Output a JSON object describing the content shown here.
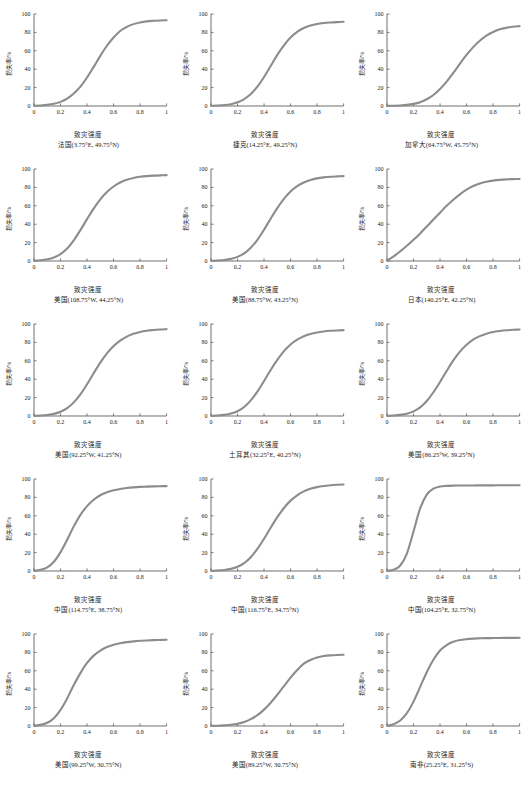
{
  "figure": {
    "axis_labels": {
      "x": "致灾强度",
      "y": "损失率/%"
    },
    "x_ticks": [
      "0",
      "0.2",
      "0.4",
      "0.6",
      "0.8",
      "1"
    ],
    "y_ticks": [
      "0",
      "20",
      "40",
      "60",
      "80",
      "100"
    ],
    "curve_color": "#8c8c8c",
    "axis_color": "#4a4a4a"
  },
  "chart_data": [
    {
      "type": "line",
      "title": "法国(3.75°E, 49.75°N)",
      "xlabel": "致灾强度",
      "ylabel": "损失率/%",
      "xlim": [
        0,
        1
      ],
      "ylim": [
        0,
        100
      ],
      "grid": false,
      "legend": "none",
      "x": [
        0,
        0.05,
        0.1,
        0.15,
        0.2,
        0.25,
        0.3,
        0.35,
        0.4,
        0.45,
        0.5,
        0.55,
        0.6,
        0.65,
        0.7,
        0.75,
        0.8,
        0.85,
        0.9,
        0.95,
        1
      ],
      "values": [
        0.3,
        0.6,
        1.2,
        2.4,
        4.5,
        8.0,
        13.5,
        21.0,
        31.0,
        42.5,
        54.5,
        65.5,
        74.5,
        81.5,
        86.0,
        89.0,
        90.8,
        92.0,
        92.6,
        93.0,
        93.2
      ]
    },
    {
      "type": "line",
      "title": "捷克(14.25°E, 49.25°N)",
      "xlabel": "致灾强度",
      "ylabel": "损失率/%",
      "xlim": [
        0,
        1
      ],
      "ylim": [
        0,
        100
      ],
      "grid": false,
      "legend": "none",
      "x": [
        0,
        0.05,
        0.1,
        0.15,
        0.2,
        0.25,
        0.3,
        0.35,
        0.4,
        0.45,
        0.5,
        0.55,
        0.6,
        0.65,
        0.7,
        0.75,
        0.8,
        0.85,
        0.9,
        0.95,
        1
      ],
      "values": [
        0.2,
        0.5,
        1.0,
        2.0,
        4.0,
        7.5,
        13.0,
        21.0,
        31.5,
        43.5,
        55.5,
        66.0,
        74.5,
        80.5,
        84.8,
        87.5,
        89.2,
        90.2,
        90.8,
        91.2,
        91.5
      ]
    },
    {
      "type": "line",
      "title": "加拿大(64.75°W, 45.75°N)",
      "xlabel": "致灾强度",
      "ylabel": "损失率/%",
      "xlim": [
        0,
        1
      ],
      "ylim": [
        0,
        100
      ],
      "grid": false,
      "legend": "none",
      "x": [
        0,
        0.05,
        0.1,
        0.15,
        0.2,
        0.25,
        0.3,
        0.35,
        0.4,
        0.45,
        0.5,
        0.55,
        0.6,
        0.65,
        0.7,
        0.75,
        0.8,
        0.85,
        0.9,
        0.95,
        1
      ],
      "values": [
        0.1,
        0.3,
        0.6,
        1.2,
        2.3,
        4.2,
        7.3,
        12.0,
        18.5,
        26.5,
        36.0,
        46.0,
        55.5,
        64.0,
        71.0,
        76.5,
        80.5,
        83.3,
        85.0,
        86.2,
        86.8
      ]
    },
    {
      "type": "line",
      "title": "美国(108.75°W, 44.25°N)",
      "xlabel": "致灾强度",
      "ylabel": "损失率/%",
      "xlim": [
        0,
        1
      ],
      "ylim": [
        0,
        100
      ],
      "grid": false,
      "legend": "none",
      "x": [
        0,
        0.05,
        0.1,
        0.15,
        0.2,
        0.25,
        0.3,
        0.35,
        0.4,
        0.45,
        0.5,
        0.55,
        0.6,
        0.65,
        0.7,
        0.75,
        0.8,
        0.85,
        0.9,
        0.95,
        1
      ],
      "values": [
        0.3,
        0.8,
        1.8,
        3.8,
        7.5,
        13.5,
        22.5,
        33.5,
        45.5,
        57.0,
        67.0,
        75.0,
        81.0,
        85.3,
        88.2,
        90.2,
        91.5,
        92.3,
        92.8,
        93.1,
        93.3
      ]
    },
    {
      "type": "line",
      "title": "美国(88.75°W, 43.25°N)",
      "xlabel": "致灾强度",
      "ylabel": "损失率/%",
      "xlim": [
        0,
        1
      ],
      "ylim": [
        0,
        100
      ],
      "grid": false,
      "legend": "none",
      "x": [
        0,
        0.05,
        0.1,
        0.15,
        0.2,
        0.25,
        0.3,
        0.35,
        0.4,
        0.45,
        0.5,
        0.55,
        0.6,
        0.65,
        0.7,
        0.75,
        0.8,
        0.85,
        0.9,
        0.95,
        1
      ],
      "values": [
        0.2,
        0.5,
        1.1,
        2.3,
        4.5,
        8.3,
        14.5,
        23.0,
        34.0,
        46.0,
        57.5,
        67.5,
        75.5,
        81.3,
        85.3,
        88.0,
        89.8,
        90.9,
        91.6,
        92.0,
        92.3
      ]
    },
    {
      "type": "line",
      "title": "日本(140.25°E, 42.25°N)",
      "xlabel": "致灾强度",
      "ylabel": "损失率/%",
      "xlim": [
        0,
        1
      ],
      "ylim": [
        0,
        100
      ],
      "grid": false,
      "legend": "none",
      "x": [
        0,
        0.05,
        0.1,
        0.15,
        0.2,
        0.25,
        0.3,
        0.35,
        0.4,
        0.45,
        0.5,
        0.55,
        0.6,
        0.65,
        0.7,
        0.75,
        0.8,
        0.85,
        0.9,
        0.95,
        1
      ],
      "values": [
        0.5,
        5.0,
        10.5,
        16.5,
        23.0,
        30.0,
        37.5,
        45.0,
        52.5,
        60.0,
        66.5,
        72.5,
        77.5,
        81.5,
        84.3,
        86.2,
        87.4,
        88.2,
        88.7,
        89.0,
        89.2
      ]
    },
    {
      "type": "line",
      "title": "美国(92.25°W, 41.25°N)",
      "xlabel": "致灾强度",
      "ylabel": "损失率/%",
      "xlim": [
        0,
        1
      ],
      "ylim": [
        0,
        100
      ],
      "grid": false,
      "legend": "none",
      "x": [
        0,
        0.05,
        0.1,
        0.15,
        0.2,
        0.25,
        0.3,
        0.35,
        0.4,
        0.45,
        0.5,
        0.55,
        0.6,
        0.65,
        0.7,
        0.75,
        0.8,
        0.85,
        0.9,
        0.95,
        1
      ],
      "values": [
        0.2,
        0.5,
        1.1,
        2.3,
        4.6,
        8.5,
        14.8,
        23.5,
        34.5,
        46.5,
        58.0,
        68.0,
        76.0,
        82.0,
        86.3,
        89.3,
        91.3,
        92.6,
        93.4,
        94.0,
        94.4
      ]
    },
    {
      "type": "line",
      "title": "土耳其(32.25°E, 40.25°N)",
      "xlabel": "致灾强度",
      "ylabel": "损失率/%",
      "xlim": [
        0,
        1
      ],
      "ylim": [
        0,
        100
      ],
      "grid": false,
      "legend": "none",
      "x": [
        0,
        0.05,
        0.1,
        0.15,
        0.2,
        0.25,
        0.3,
        0.35,
        0.4,
        0.45,
        0.5,
        0.55,
        0.6,
        0.65,
        0.7,
        0.75,
        0.8,
        0.85,
        0.9,
        0.95,
        1
      ],
      "values": [
        0.2,
        0.5,
        1.2,
        2.6,
        5.2,
        9.8,
        17.0,
        26.5,
        38.0,
        50.0,
        61.0,
        70.5,
        77.8,
        83.0,
        86.7,
        89.2,
        90.8,
        91.9,
        92.6,
        93.0,
        93.3
      ]
    },
    {
      "type": "line",
      "title": "美国(86.25°W, 39.25°N)",
      "xlabel": "致灾强度",
      "ylabel": "损失率/%",
      "xlim": [
        0,
        1
      ],
      "ylim": [
        0,
        100
      ],
      "grid": false,
      "legend": "none",
      "x": [
        0,
        0.05,
        0.1,
        0.15,
        0.2,
        0.25,
        0.3,
        0.35,
        0.4,
        0.45,
        0.5,
        0.55,
        0.6,
        0.65,
        0.7,
        0.75,
        0.8,
        0.85,
        0.9,
        0.95,
        1
      ],
      "values": [
        0.2,
        0.5,
        1.2,
        2.5,
        5.0,
        9.3,
        16.3,
        25.8,
        37.0,
        49.0,
        60.5,
        70.0,
        77.5,
        83.0,
        86.8,
        89.5,
        91.3,
        92.4,
        93.2,
        93.7,
        94.0
      ]
    },
    {
      "type": "line",
      "title": "中国(114.75°E, 38.75°N)",
      "xlabel": "致灾强度",
      "ylabel": "损失率/%",
      "xlim": [
        0,
        1
      ],
      "ylim": [
        0,
        100
      ],
      "grid": false,
      "legend": "none",
      "x": [
        0,
        0.05,
        0.1,
        0.15,
        0.2,
        0.25,
        0.3,
        0.35,
        0.4,
        0.45,
        0.5,
        0.55,
        0.6,
        0.65,
        0.7,
        0.75,
        0.8,
        0.85,
        0.9,
        0.95,
        1
      ],
      "values": [
        0.3,
        1.3,
        4.0,
        10.0,
        20.5,
        34.0,
        48.5,
        61.0,
        70.5,
        77.5,
        82.3,
        85.5,
        87.7,
        89.2,
        90.2,
        90.9,
        91.4,
        91.7,
        92.0,
        92.2,
        92.3
      ]
    },
    {
      "type": "line",
      "title": "中国(116.75°E, 34.75°N)",
      "xlabel": "致灾强度",
      "ylabel": "损失率/%",
      "xlim": [
        0,
        1
      ],
      "ylim": [
        0,
        100
      ],
      "grid": false,
      "legend": "none",
      "x": [
        0,
        0.05,
        0.1,
        0.15,
        0.2,
        0.25,
        0.3,
        0.35,
        0.4,
        0.45,
        0.5,
        0.55,
        0.6,
        0.65,
        0.7,
        0.75,
        0.8,
        0.85,
        0.9,
        0.95,
        1
      ],
      "values": [
        0.2,
        0.5,
        1.1,
        2.3,
        4.6,
        8.6,
        15.0,
        24.0,
        35.0,
        47.0,
        58.5,
        68.5,
        76.5,
        82.3,
        86.5,
        89.3,
        91.2,
        92.4,
        93.2,
        93.8,
        94.1
      ]
    },
    {
      "type": "line",
      "title": "中国(104.25°E, 32.75°N)",
      "xlabel": "致灾强度",
      "ylabel": "损失率/%",
      "xlim": [
        0,
        1
      ],
      "ylim": [
        0,
        100
      ],
      "grid": false,
      "legend": "none",
      "x": [
        0,
        0.05,
        0.1,
        0.15,
        0.2,
        0.25,
        0.3,
        0.35,
        0.4,
        0.45,
        0.5,
        0.55,
        0.6,
        0.65,
        0.7,
        0.75,
        0.8,
        0.85,
        0.9,
        0.95,
        1
      ],
      "values": [
        0.2,
        1.5,
        6.0,
        19.0,
        43.0,
        68.0,
        83.0,
        89.5,
        91.8,
        92.5,
        92.8,
        92.9,
        93.0,
        93.0,
        93.1,
        93.1,
        93.1,
        93.2,
        93.2,
        93.2,
        93.2
      ]
    },
    {
      "type": "line",
      "title": "美国(99.25°W, 30.75°N)",
      "xlabel": "致灾强度",
      "ylabel": "损失率/%",
      "xlim": [
        0,
        1
      ],
      "ylim": [
        0,
        100
      ],
      "grid": false,
      "legend": "none",
      "x": [
        0,
        0.05,
        0.1,
        0.15,
        0.2,
        0.25,
        0.3,
        0.35,
        0.4,
        0.45,
        0.5,
        0.55,
        0.6,
        0.65,
        0.7,
        0.75,
        0.8,
        0.85,
        0.9,
        0.95,
        1
      ],
      "values": [
        0.3,
        1.2,
        3.5,
        8.5,
        17.5,
        30.0,
        44.5,
        57.5,
        68.5,
        76.5,
        82.0,
        85.8,
        88.3,
        90.0,
        91.2,
        92.0,
        92.6,
        93.0,
        93.3,
        93.5,
        93.7
      ]
    },
    {
      "type": "line",
      "title": "美国(89.25°W, 30.75°N)",
      "xlabel": "致灾强度",
      "ylabel": "损失率/%",
      "xlim": [
        0,
        1
      ],
      "ylim": [
        0,
        100
      ],
      "grid": false,
      "legend": "none",
      "x": [
        0,
        0.05,
        0.1,
        0.15,
        0.2,
        0.25,
        0.3,
        0.35,
        0.4,
        0.45,
        0.5,
        0.55,
        0.6,
        0.65,
        0.7,
        0.75,
        0.8,
        0.85,
        0.9,
        0.95,
        1
      ],
      "values": [
        0.1,
        0.3,
        0.7,
        1.3,
        2.5,
        4.4,
        7.4,
        11.8,
        17.8,
        25.3,
        34.0,
        43.3,
        52.5,
        60.8,
        67.8,
        71.8,
        74.5,
        76.0,
        76.8,
        77.2,
        77.4
      ]
    },
    {
      "type": "line",
      "title": "南非(25.25°E, 31.25°S)",
      "xlabel": "致灾强度",
      "ylabel": "损失率/%",
      "xlim": [
        0,
        1
      ],
      "ylim": [
        0,
        100
      ],
      "grid": false,
      "legend": "none",
      "x": [
        0,
        0.05,
        0.1,
        0.15,
        0.2,
        0.25,
        0.3,
        0.35,
        0.4,
        0.45,
        0.5,
        0.55,
        0.6,
        0.65,
        0.7,
        0.75,
        0.8,
        0.85,
        0.9,
        0.95,
        1
      ],
      "values": [
        0.3,
        2.0,
        6.0,
        14.0,
        26.5,
        42.5,
        58.5,
        72.0,
        82.0,
        88.0,
        91.5,
        93.4,
        94.4,
        95.0,
        95.3,
        95.5,
        95.6,
        95.7,
        95.8,
        95.8,
        95.9
      ]
    }
  ]
}
